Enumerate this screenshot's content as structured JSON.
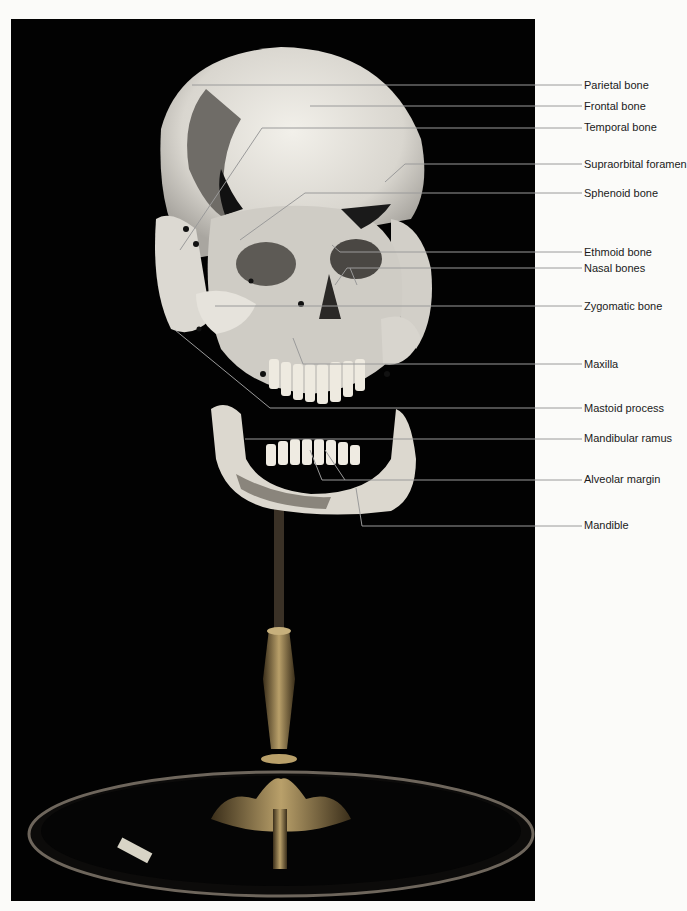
{
  "figure": {
    "colors": {
      "background": "#020202",
      "bone": "#e8e6e0",
      "leader": "#9a9a9a",
      "page": "#fbfbf9",
      "label_text": "#1a1a1a"
    }
  },
  "labels": [
    {
      "id": "parietal",
      "text": "Parietal bone",
      "y": 85
    },
    {
      "id": "frontal",
      "text": "Frontal bone",
      "y": 106
    },
    {
      "id": "temporal",
      "text": "Temporal bone",
      "y": 127
    },
    {
      "id": "supraorbital",
      "text": "Supraorbital foramen",
      "y": 164
    },
    {
      "id": "sphenoid",
      "text": "Sphenoid bone",
      "y": 193
    },
    {
      "id": "ethmoid",
      "text": "Ethmoid bone",
      "y": 252
    },
    {
      "id": "nasal",
      "text": "Nasal bones",
      "y": 268
    },
    {
      "id": "zygomatic",
      "text": "Zygomatic bone",
      "y": 306
    },
    {
      "id": "maxilla",
      "text": "Maxilla",
      "y": 364
    },
    {
      "id": "mastoid",
      "text": "Mastoid process",
      "y": 408
    },
    {
      "id": "mandibular-ramus",
      "text": "Mandibular ramus",
      "y": 438
    },
    {
      "id": "alveolar",
      "text": "Alveolar margin",
      "y": 479
    },
    {
      "id": "mandible",
      "text": "Mandible",
      "y": 525
    }
  ]
}
